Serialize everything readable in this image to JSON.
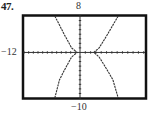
{
  "problem": {
    "number": "47."
  },
  "window_labels": {
    "ymax": "8",
    "xmin": "−12",
    "ymin": "−10"
  },
  "chart_data": {
    "type": "line",
    "title": "",
    "xlabel": "",
    "ylabel": "",
    "xlim": [
      -12,
      12
    ],
    "ylim": [
      -10,
      8
    ],
    "grid": false,
    "axes_ticks": {
      "x_step": 1,
      "y_step": 1
    },
    "tick_labels": {
      "top": "8",
      "left": "-12",
      "bottom": "-10"
    },
    "series": [
      {
        "name": "left branch",
        "x": [
          -5.4,
          -4.4,
          -3.4,
          -2.6,
          -1.8,
          -0.6,
          -1.8,
          -2.6,
          -3.4,
          -4.4,
          -5.4
        ],
        "y": [
          8,
          6,
          4,
          2.5,
          1,
          0,
          -1,
          -2.5,
          -4,
          -6,
          -10
        ]
      },
      {
        "name": "right branch",
        "x": [
          7.2,
          6.2,
          5.2,
          4.4,
          3.6,
          2.6,
          3.6,
          4.4,
          5.2,
          6.2,
          7.2
        ],
        "y": [
          8,
          6,
          4,
          2.5,
          1,
          0,
          -1,
          -2.5,
          -4,
          -6,
          -10
        ]
      }
    ],
    "shape": "hyperbola opening left/right (graphing-calculator screen)"
  }
}
